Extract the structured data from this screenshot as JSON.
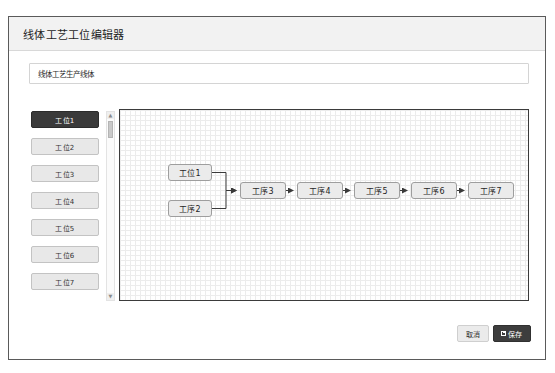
{
  "dialog": {
    "title": "线体工艺工位编辑器"
  },
  "name_field": {
    "value": "线体工艺生产线体",
    "placeholder": "请输入线体名称"
  },
  "station_list": {
    "items": [
      {
        "label": "工位1",
        "selected": true
      },
      {
        "label": "工位2",
        "selected": false
      },
      {
        "label": "工位3",
        "selected": false
      },
      {
        "label": "工位4",
        "selected": false
      },
      {
        "label": "工位5",
        "selected": false
      },
      {
        "label": "工位6",
        "selected": false
      },
      {
        "label": "工位7",
        "selected": false
      }
    ],
    "scrollbar": {
      "up_arrow": "▲",
      "down_arrow": "▼"
    }
  },
  "canvas": {
    "nodes": [
      {
        "id": "n1",
        "label": "工位1",
        "x": 48,
        "y": 54,
        "w": 44,
        "h": 17
      },
      {
        "id": "n2",
        "label": "工序2",
        "x": 48,
        "y": 90,
        "w": 44,
        "h": 17
      },
      {
        "id": "n3",
        "label": "工序3",
        "x": 120,
        "y": 72,
        "w": 46,
        "h": 17
      },
      {
        "id": "n4",
        "label": "工序4",
        "x": 177,
        "y": 72,
        "w": 46,
        "h": 17
      },
      {
        "id": "n5",
        "label": "工序5",
        "x": 234,
        "y": 72,
        "w": 46,
        "h": 17
      },
      {
        "id": "n6",
        "label": "工序6",
        "x": 291,
        "y": 72,
        "w": 46,
        "h": 17
      },
      {
        "id": "n7",
        "label": "工序7",
        "x": 348,
        "y": 72,
        "w": 46,
        "h": 17
      }
    ],
    "edges": [
      {
        "from": "n1",
        "to": "n3"
      },
      {
        "from": "n2",
        "to": "n3"
      },
      {
        "from": "n3",
        "to": "n4"
      },
      {
        "from": "n4",
        "to": "n5"
      },
      {
        "from": "n5",
        "to": "n6"
      },
      {
        "from": "n6",
        "to": "n7"
      }
    ]
  },
  "footer": {
    "cancel_label": "取消",
    "save_label": "保存"
  },
  "colors": {
    "frame_border": "#5a5a5a",
    "header_bg": "#f2f2f2",
    "selected_item_bg": "#3a3a3a",
    "save_button_bg": "#3d3d3d",
    "node_bg": "#ebebeb",
    "canvas_border": "#3b3b3b"
  }
}
